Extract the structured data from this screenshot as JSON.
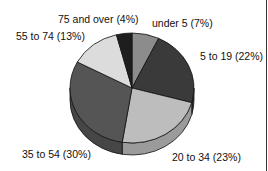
{
  "chart_data": {
    "type": "pie",
    "style": "3d",
    "title": "",
    "categories": [
      "under 5",
      "5 to 19",
      "20 to 34",
      "35 to 54",
      "55 to 74",
      "75 and over"
    ],
    "values": [
      7,
      22,
      23,
      30,
      13,
      4
    ],
    "unit": "%",
    "labels": [
      "under 5 (7%)",
      "5 to 19 (22%)",
      "20 to 34 (23%)",
      "35 to 54 (30%)",
      "55 to 74 (13%)",
      "75 and over (4%)"
    ],
    "colors": [
      "#8c8c8c",
      "#3a3a3a",
      "#bdbdbd",
      "#555555",
      "#dcdcdc",
      "#1e1e1e"
    ],
    "legend": "none (direct labels)",
    "start_angle": "12 o'clock, clockwise"
  }
}
